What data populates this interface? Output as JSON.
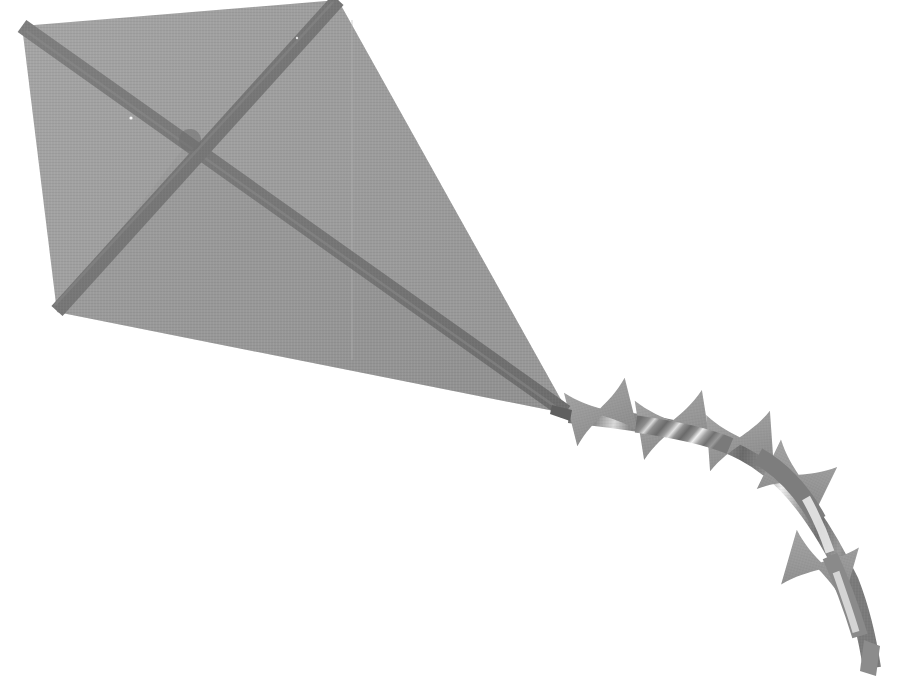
{
  "scene": {
    "title": "Kite with bow-tie tail",
    "width": 903,
    "height": 689,
    "background_color": "#ffffff"
  },
  "colors": {
    "background": "#ffffff",
    "sail_light": "#a3a3a3",
    "sail_mid": "#9b9b9b",
    "sail_dark": "#959595",
    "spar": "#787878",
    "spar_shadow": "#6f6f6f",
    "ribbon_fill": "#9a9a9a",
    "ribbon_shade": "#8a8a8a",
    "tail_strip_dark": "#6e6e6e",
    "tail_strip_light": "#d8d8d8",
    "tail_highlight": "#f2f2f2",
    "seam_line": "#b2b2b2"
  },
  "kite": {
    "name": "diamond-kite",
    "vertices": {
      "top": [
        338,
        0
      ],
      "left": [
        57,
        312
      ],
      "nose_tip": [
        569,
        414
      ],
      "upper_left": [
        22,
        26
      ]
    },
    "outline_points": "338,0 22,26 57,312 569,414",
    "spar_cross_point": [
      190,
      140
    ],
    "seam_x": 352,
    "spars": [
      {
        "name": "spar-left-diagonal",
        "from": [
          22,
          26
        ],
        "to": [
          569,
          414
        ],
        "width": 14
      },
      {
        "name": "spar-right-diagonal",
        "from": [
          338,
          0
        ],
        "to": [
          57,
          312
        ],
        "width": 14
      }
    ]
  },
  "tail": {
    "name": "kite-tail",
    "attach_point": [
      569,
      414
    ],
    "path": "M569,414 C640,424 700,432 742,452 C786,473 820,520 852,580 C862,608 868,640 872,668",
    "strip_width": 17,
    "end_point": [
      872,
      668
    ],
    "ribbon_count": 6,
    "ribbons": [
      {
        "name": "ribbon-1",
        "cx": 600,
        "cy": 410,
        "size": 62,
        "rotation": -12,
        "fill": "#9a9a9a"
      },
      {
        "name": "ribbon-2",
        "cx": 672,
        "cy": 425,
        "size": 66,
        "rotation": -8,
        "fill": "#9a9a9a"
      },
      {
        "name": "ribbon-3",
        "cx": 738,
        "cy": 440,
        "size": 62,
        "rotation": -4,
        "fill": "#9a9a9a"
      },
      {
        "name": "ribbon-4",
        "cx": 795,
        "cy": 477,
        "size": 60,
        "rotation": 28,
        "fill": "#9a9a9a"
      },
      {
        "name": "ribbon-5",
        "cx": 818,
        "cy": 565,
        "size": 62,
        "rotation": 18,
        "fill": "#9a9a9a"
      }
    ]
  },
  "texture": {
    "weave_opacity": 0.08,
    "weave_spacing": 3
  }
}
